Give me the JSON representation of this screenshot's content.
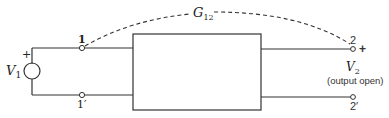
{
  "diagram": {
    "type": "two-port network",
    "colors": {
      "line": "#333333",
      "background": "#ffffff"
    },
    "source": {
      "label": "V",
      "subscript": "1",
      "polarity": "+"
    },
    "input_terminals": [
      {
        "id": "1",
        "label": "1"
      },
      {
        "id": "1p",
        "label": "1′"
      }
    ],
    "output_terminals": [
      {
        "id": "2",
        "label": "2"
      },
      {
        "id": "2p",
        "label": "2′"
      }
    ],
    "output": {
      "label": "V",
      "subscript": "2",
      "polarity": "+",
      "note": "(output open)"
    },
    "transfer": {
      "label": "G",
      "subscript": "12"
    }
  }
}
